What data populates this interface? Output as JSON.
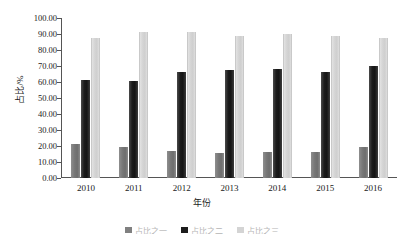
{
  "chart_data": {
    "type": "bar",
    "title": "",
    "xlabel": "年份",
    "ylabel": "占比/%",
    "categories": [
      "2010",
      "2011",
      "2012",
      "2013",
      "2014",
      "2015",
      "2016"
    ],
    "series": [
      {
        "name": "占比之一",
        "color": "#808080",
        "values": [
          21.5,
          19.5,
          17.0,
          15.5,
          16.0,
          16.5,
          19.5
        ]
      },
      {
        "name": "占比之二",
        "color": "#1c1c1c",
        "values": [
          61.5,
          60.5,
          66.5,
          67.5,
          68.0,
          66.5,
          70.0
        ]
      },
      {
        "name": "占比之三",
        "color": "#d4d4d4",
        "values": [
          87.5,
          91.0,
          91.5,
          88.5,
          90.0,
          89.0,
          87.5
        ]
      }
    ],
    "ylim": [
      0,
      100
    ],
    "ytick_labels": [
      "100.00",
      "90.00",
      "80.00",
      "70.00",
      "60.00",
      "50.00",
      "40.00",
      "30.00",
      "20.00",
      "10.00",
      "0.00"
    ],
    "ytick_values": [
      100,
      90,
      80,
      70,
      60,
      50,
      40,
      30,
      20,
      10,
      0
    ],
    "grid": false,
    "legend_position": "bottom"
  },
  "colors": {
    "axis": "#555555",
    "text": "#1a1a1a",
    "background": "#ffffff"
  }
}
